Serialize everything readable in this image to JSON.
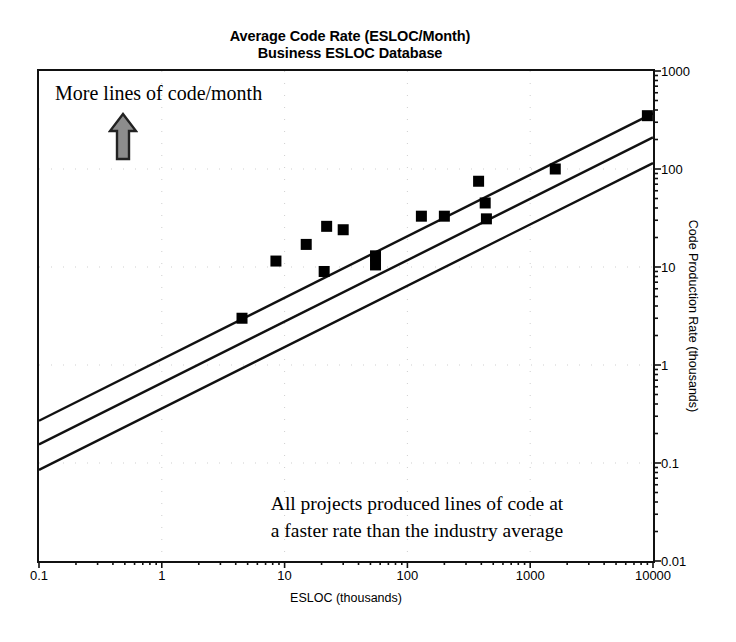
{
  "title": {
    "line1": "Average Code Rate (ESLOC/Month)",
    "line2": "Business ESLOC Database"
  },
  "annotations": {
    "top": "More lines of code/month",
    "arrow_icon": "up-arrow-icon",
    "bottom_line1": "All projects produced lines of code at",
    "bottom_line2": "a faster rate than the industry average"
  },
  "colors": {
    "marker": "#000000",
    "line": "#111111",
    "frame": "#111111",
    "grid": "#cfcfcf",
    "arrow_fill": "#8c8c8c",
    "arrow_stroke": "#222222",
    "text": "#000000",
    "background": "#ffffff"
  },
  "chart_data": {
    "type": "scatter",
    "xlabel": "ESLOC (thousands)",
    "ylabel": "Code Production Rate (thousands)",
    "xscale": "log",
    "yscale": "log",
    "xlim": [
      0.1,
      10000
    ],
    "ylim": [
      0.01,
      1000
    ],
    "xticks": [
      0.1,
      1,
      10,
      100,
      1000,
      10000
    ],
    "xticklabels": [
      "0.1",
      "1",
      "10",
      "100",
      "1000",
      "10000"
    ],
    "yticks": [
      0.01,
      0.1,
      1,
      10,
      100,
      1000
    ],
    "yticklabels": [
      "0.01",
      "0.1",
      "1",
      "10",
      "100",
      "1000"
    ],
    "grid": true,
    "grid_style": "dotted",
    "legend": "none",
    "minor_ticks": true,
    "points": [
      {
        "x": 4.5,
        "y": 3.0
      },
      {
        "x": 8.5,
        "y": 11.5
      },
      {
        "x": 15.0,
        "y": 17.0
      },
      {
        "x": 21.0,
        "y": 9.0
      },
      {
        "x": 22.0,
        "y": 26.0
      },
      {
        "x": 30.0,
        "y": 24.0
      },
      {
        "x": 55.0,
        "y": 13.0
      },
      {
        "x": 55.0,
        "y": 10.5
      },
      {
        "x": 130.0,
        "y": 33.0
      },
      {
        "x": 200.0,
        "y": 33.0
      },
      {
        "x": 380.0,
        "y": 75.0
      },
      {
        "x": 430.0,
        "y": 45.0
      },
      {
        "x": 440.0,
        "y": 31.0
      },
      {
        "x": 1600.0,
        "y": 100.0
      },
      {
        "x": 9000.0,
        "y": 350.0
      }
    ],
    "trend_lines": [
      {
        "name": "upper-bound-line",
        "x0": 0.1,
        "y0": 0.27,
        "x1": 10000,
        "y1": 370.0
      },
      {
        "name": "middle-bound-line",
        "x0": 0.1,
        "y0": 0.155,
        "x1": 10000,
        "y1": 210.0
      },
      {
        "name": "industry-average-line",
        "x0": 0.1,
        "y0": 0.085,
        "x1": 10000,
        "y1": 115.0
      }
    ]
  }
}
